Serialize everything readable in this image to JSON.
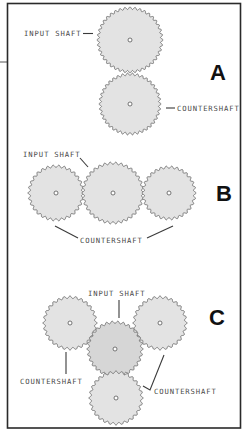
{
  "figure": {
    "panels": [
      {
        "letter": "A",
        "labels": {
          "input": "INPUT SHAFT",
          "counter": "COUNTERSHAFT"
        },
        "gears": [
          {
            "role": "input-shaft",
            "cx": 130,
            "cy": 40,
            "r": 33,
            "teeth": 40
          },
          {
            "role": "countershaft",
            "cx": 130,
            "cy": 104,
            "r": 31,
            "teeth": 38
          }
        ]
      },
      {
        "letter": "B",
        "labels": {
          "input": "INPUT SHAFT",
          "counter": "COUNTERSHAFT"
        },
        "gears": [
          {
            "role": "countershaft-left",
            "cx": 56,
            "cy": 193,
            "r": 28,
            "teeth": 30
          },
          {
            "role": "input-shaft",
            "cx": 113,
            "cy": 193,
            "r": 31,
            "teeth": 34
          },
          {
            "role": "countershaft-right",
            "cx": 169,
            "cy": 193,
            "r": 27,
            "teeth": 30
          }
        ]
      },
      {
        "letter": "C",
        "labels": {
          "input": "INPUT SHAFT",
          "counter_left": "COUNTERSHAFT",
          "counter_right": "COUNTERSHAFT"
        },
        "gears": [
          {
            "role": "countershaft-top-left",
            "cx": 70,
            "cy": 323,
            "r": 27,
            "teeth": 28
          },
          {
            "role": "countershaft-top-right",
            "cx": 160,
            "cy": 323,
            "r": 27,
            "teeth": 28
          },
          {
            "role": "input-shaft",
            "cx": 115,
            "cy": 349,
            "r": 28,
            "teeth": 30
          },
          {
            "role": "countershaft-bottom",
            "cx": 116,
            "cy": 398,
            "r": 27,
            "teeth": 28
          }
        ]
      }
    ],
    "colors": {
      "gear_fill": "#e3e3e3",
      "gear_fill_input_c": "#d6d6d6",
      "gear_stroke": "#6e6e6e",
      "frame": "#2a2a2a",
      "letter": "#111111",
      "label": "#4a4a4a"
    }
  }
}
